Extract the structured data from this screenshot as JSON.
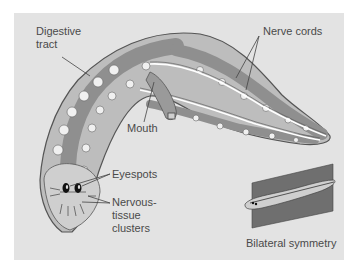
{
  "figure": {
    "labels": {
      "digestive_tract": [
        "Digestive",
        "tract"
      ],
      "nerve_cords": "Nerve cords",
      "mouth": "Mouth",
      "eyespots": "Eyespots",
      "nervous_tissue_clusters": [
        "Nervous-",
        "tissue",
        "clusters"
      ],
      "bilateral_symmetry": "Bilateral symmetry"
    },
    "colors": {
      "panel_background": "#e3e3e3",
      "body_fill": "#bdbdbd",
      "gut_fill": "#8f8f8f",
      "branch_fill": "#f0f0f0",
      "outline": "#555555",
      "plane_fill": "#6f6f6f",
      "label_text": "#4a4a4a"
    }
  }
}
